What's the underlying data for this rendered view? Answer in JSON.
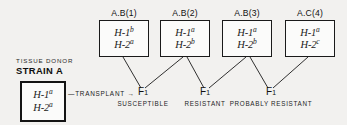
{
  "figure": {
    "type": "genetic-transplant-pedigree-diagram",
    "background_color": "#f2f1ef",
    "line_color": "#1a1a1a"
  },
  "donor": {
    "caption_line1": "TISSUE DONOR",
    "caption_line2": "STRAIN A",
    "genotype": [
      {
        "locus": "H-1",
        "allele": "a"
      },
      {
        "locus": "H-2",
        "allele": "a"
      }
    ]
  },
  "transplant": {
    "label": "TRANSPLANT",
    "arrow_glyph": "→",
    "dash_glyph": "—"
  },
  "recipients": [
    {
      "strain_label": "A.B(1)",
      "genotype": [
        {
          "locus": "H-1",
          "allele": "b"
        },
        {
          "locus": "H-2",
          "allele": "a"
        }
      ]
    },
    {
      "strain_label": "A.B(2)",
      "genotype": [
        {
          "locus": "H-1",
          "allele": "a"
        },
        {
          "locus": "H-2",
          "allele": "b"
        }
      ]
    },
    {
      "strain_label": "A.B(3)",
      "genotype": [
        {
          "locus": "H-1",
          "allele": "a"
        },
        {
          "locus": "H-2",
          "allele": "b"
        }
      ]
    },
    {
      "strain_label": "A.C(4)",
      "genotype": [
        {
          "locus": "H-1",
          "allele": "a"
        },
        {
          "locus": "H-2",
          "allele": "c"
        }
      ]
    }
  ],
  "outcomes": [
    {
      "generation": "F",
      "subscript": "1",
      "verdict": "SUSCEPTIBLE"
    },
    {
      "generation": "F",
      "subscript": "1",
      "verdict": "RESISTANT"
    },
    {
      "generation": "F",
      "subscript": "1",
      "verdict": "PROBABLY RESISTANT"
    }
  ]
}
